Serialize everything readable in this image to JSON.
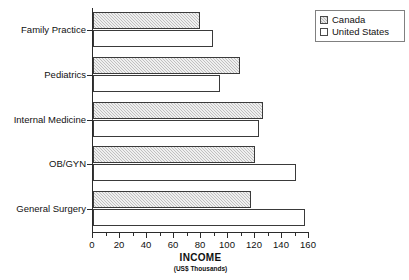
{
  "chart_data": {
    "type": "bar",
    "orientation": "horizontal",
    "title": "",
    "xlabel": "INCOME",
    "xlabel_sub": "(US$ Thousands)",
    "ylabel": "",
    "xlim": [
      0,
      160
    ],
    "xticks": [
      0,
      20,
      40,
      60,
      80,
      100,
      120,
      140,
      160
    ],
    "xminor_step": 10,
    "grid": false,
    "legend_position": "top-right",
    "categories": [
      "Family Practice",
      "Pediatrics",
      "Internal Medicine",
      "OB/GYN",
      "General Surgery"
    ],
    "series": [
      {
        "name": "Canada",
        "color": "#c0c0c0",
        "pattern": "hatched",
        "values": [
          79,
          109,
          126,
          120,
          117
        ]
      },
      {
        "name": "United States",
        "color": "#ffffff",
        "pattern": "solid",
        "values": [
          89,
          94,
          123,
          150,
          157
        ]
      }
    ]
  },
  "legend": {
    "items": [
      {
        "label": "Canada",
        "swatch": "hatched-gray-square-icon"
      },
      {
        "label": "United States",
        "swatch": "white-square-icon"
      }
    ]
  },
  "axis": {
    "x_tick_labels": [
      "0",
      "20",
      "40",
      "60",
      "80",
      "100",
      "120",
      "140",
      "160"
    ],
    "title": "INCOME",
    "subtitle": "(US$ Thousands)"
  }
}
